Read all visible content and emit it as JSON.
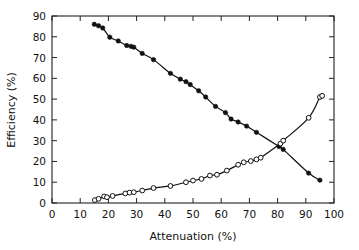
{
  "chart_data": {
    "type": "scatter",
    "title": "",
    "xlabel": "Attenuation (%)",
    "ylabel": "Efficiency (%)",
    "xlim": [
      0,
      100
    ],
    "ylim": [
      0,
      90
    ],
    "xticks": [
      0,
      10,
      20,
      30,
      40,
      50,
      60,
      70,
      80,
      90,
      100
    ],
    "yticks": [
      0,
      10,
      20,
      30,
      40,
      50,
      60,
      70,
      80,
      90
    ],
    "xtick_labels": [
      "0",
      "10",
      "20",
      "30",
      "40",
      "50",
      "60",
      "70",
      "80",
      "90",
      "100"
    ],
    "ytick_labels": [
      "0",
      "10",
      "20",
      "30",
      "40",
      "50",
      "60",
      "70",
      "80",
      "90"
    ],
    "grid": false,
    "legend": "none",
    "frame": "box-all-sides-inward-ticks",
    "series": [
      {
        "name": "decreasing-efficiency",
        "marker": "filled-circle",
        "line": "fitted-curve",
        "points": [
          [
            15.0,
            86.0
          ],
          [
            16.5,
            85.3
          ],
          [
            18.0,
            84.2
          ],
          [
            20.5,
            79.8
          ],
          [
            23.5,
            78.0
          ],
          [
            26.5,
            75.8
          ],
          [
            28.0,
            75.4
          ],
          [
            29.0,
            75.0
          ],
          [
            32.0,
            72.0
          ],
          [
            36.0,
            69.0
          ],
          [
            42.0,
            62.4
          ],
          [
            45.5,
            59.6
          ],
          [
            47.5,
            58.4
          ],
          [
            49.0,
            57.0
          ],
          [
            52.0,
            54.0
          ],
          [
            54.5,
            51.0
          ],
          [
            58.0,
            46.5
          ],
          [
            61.5,
            43.5
          ],
          [
            63.5,
            40.4
          ],
          [
            66.0,
            39.0
          ],
          [
            69.0,
            37.0
          ],
          [
            72.5,
            34.0
          ],
          [
            80.5,
            27.2
          ],
          [
            82.0,
            25.8
          ],
          [
            91.0,
            14.4
          ],
          [
            95.0,
            11.0
          ]
        ]
      },
      {
        "name": "increasing-efficiency",
        "marker": "open-circle",
        "line": "fitted-curve",
        "points": [
          [
            15.2,
            1.4
          ],
          [
            16.5,
            2.0
          ],
          [
            18.5,
            3.2
          ],
          [
            19.5,
            2.8
          ],
          [
            21.5,
            3.4
          ],
          [
            26.0,
            4.6
          ],
          [
            27.5,
            5.0
          ],
          [
            29.0,
            5.2
          ],
          [
            32.0,
            6.0
          ],
          [
            36.0,
            7.2
          ],
          [
            42.0,
            8.2
          ],
          [
            47.5,
            10.0
          ],
          [
            50.0,
            10.8
          ],
          [
            53.0,
            11.6
          ],
          [
            56.0,
            13.2
          ],
          [
            58.5,
            13.6
          ],
          [
            62.0,
            15.6
          ],
          [
            66.0,
            18.4
          ],
          [
            68.0,
            19.6
          ],
          [
            70.5,
            20.2
          ],
          [
            72.5,
            21.0
          ],
          [
            74.0,
            21.8
          ],
          [
            81.0,
            28.6
          ],
          [
            82.0,
            30.0
          ],
          [
            91.0,
            41.0
          ],
          [
            95.0,
            51.0
          ],
          [
            95.8,
            51.6
          ]
        ]
      }
    ]
  }
}
